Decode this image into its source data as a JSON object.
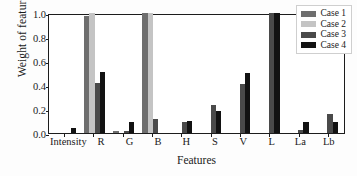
{
  "chart_data": {
    "type": "bar",
    "title": "",
    "xlabel": "Features",
    "ylabel": "Weight of features",
    "categories": [
      "Intensity",
      "R",
      "G",
      "B",
      "H",
      "S",
      "V",
      "L",
      "La",
      "Lb"
    ],
    "series": [
      {
        "name": "Case 1",
        "color": "#6e6e6e",
        "values": [
          0.0,
          0.975,
          0.017,
          1.0,
          0.0,
          0.0,
          0.0,
          0.0,
          0.0,
          0.0
        ]
      },
      {
        "name": "Case 2",
        "color": "#c4c4c4",
        "values": [
          0.0,
          1.0,
          0.0,
          1.0,
          0.0,
          0.0,
          0.0,
          0.0,
          0.0,
          0.0
        ]
      },
      {
        "name": "Case 3",
        "color": "#4a4a4a",
        "values": [
          0.0,
          0.42,
          0.013,
          0.115,
          0.095,
          0.23,
          0.405,
          1.0,
          0.025,
          0.16
        ]
      },
      {
        "name": "Case 4",
        "color": "#121212",
        "values": [
          0.045,
          0.505,
          0.09,
          0.0,
          0.1,
          0.18,
          0.5,
          1.0,
          0.095,
          0.09
        ]
      }
    ],
    "ylim": [
      0.0,
      1.0
    ],
    "yticks": [
      "0.0",
      "0.2",
      "0.4",
      "0.6",
      "0.8",
      "1.0"
    ],
    "ytick_values": [
      0.0,
      0.2,
      0.4,
      0.6,
      0.8,
      1.0
    ],
    "grid": false,
    "legend_position": "upper right"
  }
}
